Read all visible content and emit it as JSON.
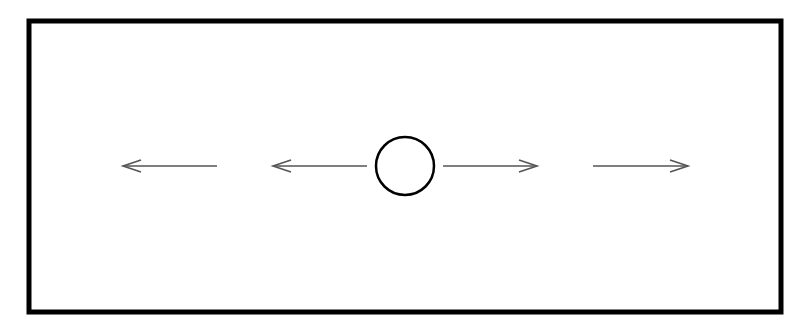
{
  "diagram": {
    "frame": {
      "x": 29,
      "y": 21,
      "width": 752,
      "height": 291,
      "stroke": "#000000",
      "stroke_width": 5
    },
    "circle": {
      "cx": 405,
      "cy": 166,
      "r": 29,
      "stroke": "#000000",
      "stroke_width": 2.5
    },
    "arrows": [
      {
        "id": "arrow-far-left",
        "x1": 217,
        "y1": 166,
        "x2": 123,
        "y2": 166,
        "direction": "left"
      },
      {
        "id": "arrow-near-left",
        "x1": 367,
        "y1": 166,
        "x2": 273,
        "y2": 166,
        "direction": "left"
      },
      {
        "id": "arrow-near-right",
        "x1": 443,
        "y1": 166,
        "x2": 537,
        "y2": 166,
        "direction": "right"
      },
      {
        "id": "arrow-far-right",
        "x1": 593,
        "y1": 166,
        "x2": 688,
        "y2": 166,
        "direction": "right"
      }
    ],
    "arrow_color": "#555555"
  }
}
